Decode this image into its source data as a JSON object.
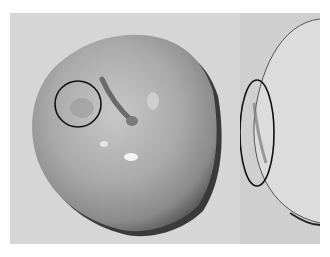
{
  "image": {
    "description": "Grayscale photograph of an apple shown from the top (left panel) and side (right panel), with black outlines marking surface defects",
    "panels": [
      {
        "name": "top-view",
        "annotation": "circle"
      },
      {
        "name": "side-view",
        "annotation": "ellipse"
      }
    ],
    "colors": {
      "background": "#d6d6d6",
      "annotation_stroke": "#111111",
      "apple_mid": "#a8a8a8",
      "apple_dark": "#3a3a3a"
    }
  }
}
